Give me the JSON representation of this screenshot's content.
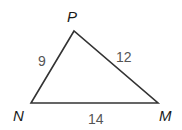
{
  "diagram": {
    "type": "triangle",
    "vertices": [
      {
        "name": "P",
        "x": 74,
        "y": 31,
        "label_x": 73,
        "label_y": 22
      },
      {
        "name": "N",
        "x": 31,
        "y": 103,
        "label_x": 17,
        "label_y": 121
      },
      {
        "name": "M",
        "x": 158,
        "y": 103,
        "label_x": 163,
        "label_y": 121
      }
    ],
    "sides": [
      {
        "from": "N",
        "to": "P",
        "length": "9",
        "label_x": 39,
        "label_y": 67
      },
      {
        "from": "P",
        "to": "M",
        "length": "12",
        "label_x": 118,
        "label_y": 62
      },
      {
        "from": "N",
        "to": "M",
        "length": "14",
        "label_x": 88,
        "label_y": 123
      }
    ],
    "colors": {
      "edge": "#333333",
      "side_label": "#555555",
      "vertex_label": "#1a1a1a"
    }
  }
}
